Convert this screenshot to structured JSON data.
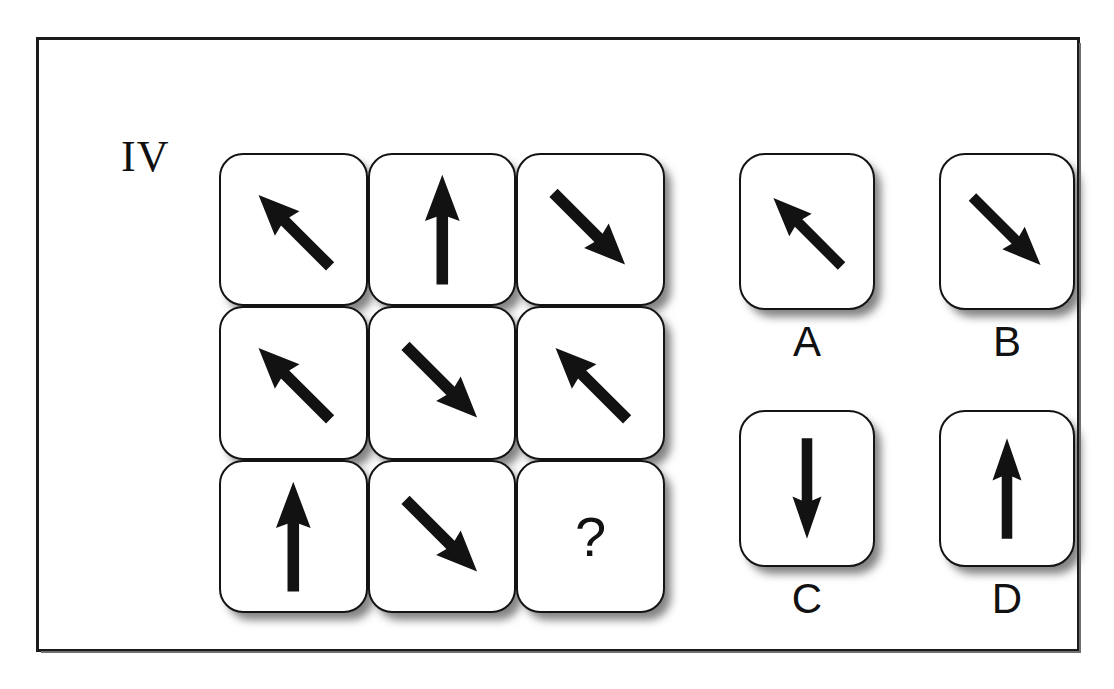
{
  "item": {
    "numeral": "IV",
    "type": "matrix-reasoning",
    "missing_cell_glyph": "?"
  },
  "matrix": {
    "rows": 3,
    "columns": 3,
    "cells": [
      {
        "id": "r1c1",
        "icon": "arrow-up-left-icon",
        "direction": "up-left",
        "angle_deg": 135
      },
      {
        "id": "r1c2",
        "icon": "arrow-up-icon",
        "direction": "up",
        "angle_deg": 90
      },
      {
        "id": "r1c3",
        "icon": "arrow-down-left-icon",
        "direction": "down-left",
        "angle_deg": 225
      },
      {
        "id": "r2c1",
        "icon": "arrow-up-left-icon",
        "direction": "up-left",
        "angle_deg": 135
      },
      {
        "id": "r2c2",
        "icon": "arrow-down-left-icon",
        "direction": "down-left",
        "angle_deg": 225
      },
      {
        "id": "r2c3",
        "icon": "arrow-up-left-icon",
        "direction": "up-left",
        "angle_deg": 135
      },
      {
        "id": "r3c1",
        "icon": "arrow-up-icon",
        "direction": "up",
        "angle_deg": 90
      },
      {
        "id": "r3c2",
        "icon": "arrow-down-left-icon",
        "direction": "down-left",
        "angle_deg": 225
      },
      {
        "id": "r3c3",
        "icon": "question-mark-icon",
        "direction": "unknown",
        "angle_deg": null,
        "label": "?"
      }
    ]
  },
  "options": [
    {
      "id": "A",
      "label": "A",
      "icon": "arrow-up-left-icon",
      "direction": "up-left",
      "angle_deg": 135
    },
    {
      "id": "B",
      "label": "B",
      "icon": "arrow-down-left-icon",
      "direction": "down-left",
      "angle_deg": 225
    },
    {
      "id": "C",
      "label": "C",
      "icon": "arrow-down-icon",
      "direction": "down",
      "angle_deg": 270
    },
    {
      "id": "D",
      "label": "D",
      "icon": "arrow-up-icon",
      "direction": "up",
      "angle_deg": 90
    }
  ],
  "colors": {
    "frame_border": "#1b1b1b",
    "card_border": "#141414",
    "card_fill": "#ffffff",
    "arrow": "#121212",
    "shadow": "rgba(30,30,30,0.55)",
    "page_background": "#ffffff"
  }
}
